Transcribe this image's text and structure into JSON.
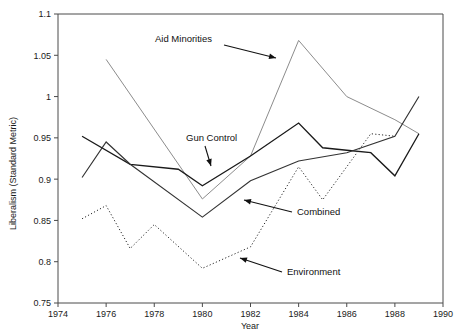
{
  "chart_data": {
    "type": "line",
    "title": "",
    "xlabel": "Year",
    "ylabel": "Liberalism (Standard Metric)",
    "xlim": [
      1974,
      1990
    ],
    "ylim": [
      0.75,
      1.1
    ],
    "xticks": [
      1974,
      1976,
      1978,
      1980,
      1982,
      1984,
      1986,
      1988,
      1990
    ],
    "yticks": [
      0.75,
      0.8,
      0.85,
      0.9,
      0.95,
      1,
      1.05,
      1.1
    ],
    "xtick_labels": [
      "1974",
      "1976",
      "1978",
      "1980",
      "1982",
      "1984",
      "1986",
      "1988",
      "1990"
    ],
    "ytick_labels": [
      "0.75",
      "0.8",
      "0.85",
      "0.9",
      "0.95",
      "1",
      "1.05",
      "1.1"
    ],
    "grid": false,
    "legend": "annotations",
    "series": [
      {
        "name": "Aid Minorities",
        "style": "solid-light",
        "color": "#8c8c8c",
        "width": 1,
        "x": [
          1976,
          1980,
          1982,
          1984,
          1986,
          1988,
          1989
        ],
        "values": [
          1.045,
          0.876,
          0.928,
          1.068,
          1.0,
          0.972,
          0.955
        ]
      },
      {
        "name": "Gun Control",
        "style": "solid-dark",
        "color": "#1a1a1a",
        "width": 1.3,
        "x": [
          1975,
          1977,
          1979,
          1980,
          1982,
          1984,
          1985,
          1986,
          1987,
          1988,
          1989
        ],
        "values": [
          0.952,
          0.918,
          0.912,
          0.892,
          0.928,
          0.968,
          0.938,
          0.935,
          0.932,
          0.904,
          0.955
        ]
      },
      {
        "name": "Combined",
        "style": "solid-medium",
        "color": "#333333",
        "width": 1.15,
        "x": [
          1975,
          1976,
          1977,
          1980,
          1982,
          1984,
          1986,
          1988,
          1989
        ],
        "values": [
          0.902,
          0.945,
          0.918,
          0.854,
          0.898,
          0.922,
          0.932,
          0.952,
          1.0
        ]
      },
      {
        "name": "Environment",
        "style": "dotted",
        "color": "#2a2a2a",
        "width": 1,
        "x": [
          1975,
          1976,
          1977,
          1978,
          1980,
          1982,
          1984,
          1985,
          1987,
          1988
        ],
        "values": [
          0.852,
          0.868,
          0.816,
          0.845,
          0.792,
          0.818,
          0.915,
          0.875,
          0.955,
          0.952
        ]
      }
    ],
    "annotations": [
      {
        "label": "Aid Minorities",
        "text_x": 155,
        "text_y": 42,
        "arrow_x1": 224,
        "arrow_y1": 45,
        "arrow_x2": 276,
        "arrow_y2": 58
      },
      {
        "label": "Gun Control",
        "text_x": 186,
        "text_y": 141,
        "arrow_x1": 205,
        "arrow_y1": 146,
        "arrow_x2": 211,
        "arrow_y2": 166
      },
      {
        "label": "Combined",
        "text_x": 297,
        "text_y": 215,
        "arrow_x1": 292,
        "arrow_y1": 212,
        "arrow_x2": 244,
        "arrow_y2": 200
      },
      {
        "label": "Environment",
        "text_x": 287,
        "text_y": 275,
        "arrow_x1": 282,
        "arrow_y1": 272,
        "arrow_x2": 240,
        "arrow_y2": 258
      }
    ]
  }
}
